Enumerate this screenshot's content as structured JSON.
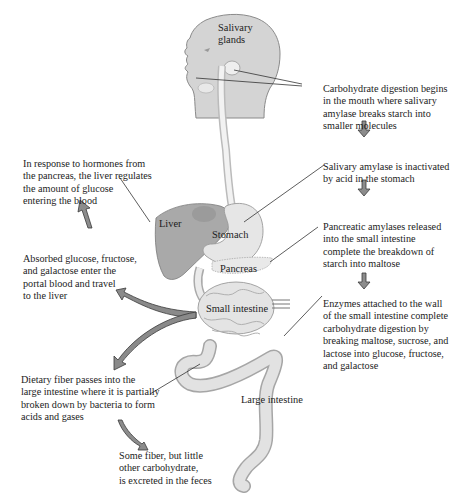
{
  "figure": {
    "colors": {
      "body_fill": "#d4d4d4",
      "body_stroke": "#8a8a8a",
      "organ_fill": "#e6e6e6",
      "liver_fill": "#a9a9a9",
      "arrow_fill": "#8c8c8c",
      "arrow_stroke": "#3a3a3a",
      "leader_line": "#333333",
      "text": "#1c1c1c"
    },
    "organ_labels": {
      "salivary_glands": "Salivary\nglands",
      "liver": "Liver",
      "stomach": "Stomach",
      "pancreas": "Pancreas",
      "small_intestine": "Small intestine",
      "large_intestine": "Large intestine"
    },
    "right_steps": [
      {
        "text": "Carbohydrate digestion begins\nin the mouth where salivary\namylase breaks starch into\nsmaller molecules"
      },
      {
        "text": "Salivary amylase is inactivated\nby acid in the stomach"
      },
      {
        "text": "Pancreatic amylases released\ninto the small intestine\ncomplete the breakdown of\nstarch into maltose"
      },
      {
        "text": "Enzymes attached to the wall\nof the small intestine complete\ncarbohydrate digestion by\nbreaking maltose, sucrose, and\nlactose into glucose, fructose,\nand galactose"
      }
    ],
    "left_notes": {
      "liver_regulation": "In response to hormones from\nthe pancreas, the liver regulates\nthe amount of glucose\nentering the blood",
      "absorption": "Absorbed glucose, fructose,\nand galactose enter the\nportal blood and travel\nto the liver",
      "fiber": "Dietary fiber passes into the\nlarge intestine where it is partially\nbroken down by bacteria to form\nacids and gases",
      "excretion": "Some fiber, but little\nother carbohydrate,\nis excreted in the feces"
    }
  }
}
